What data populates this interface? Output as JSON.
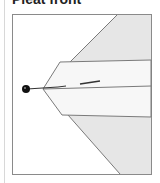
{
  "title": "Pleat front",
  "diagram": {
    "frame": {
      "x": 12,
      "y": 14,
      "width": 140,
      "height": 161,
      "stroke": "#8a8a8a"
    },
    "colors": {
      "shaded_fabric": "#e6e6e6",
      "band": "#f7f7f7",
      "outline": "#7a7a7a",
      "pin_head": "#111111",
      "pin_shaft": "#333333"
    },
    "parts": [
      {
        "name": "upper-fabric-panel",
        "label": ""
      },
      {
        "name": "folded-pleat-band",
        "label": ""
      },
      {
        "name": "lower-fabric-panel",
        "label": ""
      },
      {
        "name": "pin",
        "label": ""
      }
    ]
  }
}
